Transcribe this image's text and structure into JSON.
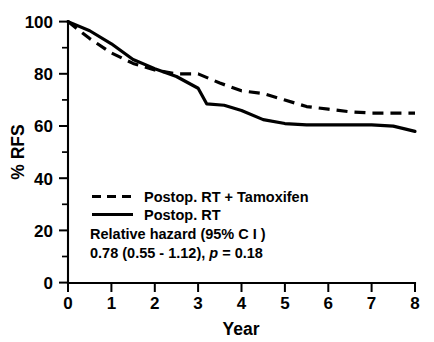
{
  "chart_data": {
    "type": "line",
    "title": "",
    "xlabel": "Year",
    "ylabel": "% RFS",
    "xlim": [
      0,
      8
    ],
    "ylim": [
      0,
      100
    ],
    "xticks": [
      "0",
      "1",
      "2",
      "3",
      "4",
      "5",
      "6",
      "7",
      "8"
    ],
    "yticks": [
      "0",
      "20",
      "40",
      "60",
      "80",
      "100"
    ],
    "y_minor_ticks": [
      10,
      30,
      50,
      70,
      90
    ],
    "grid": false,
    "legend_position": "inside-lower-left",
    "series": [
      {
        "name": "Postop. RT + Tamoxifen",
        "style": "dashed",
        "color": "#000000",
        "x": [
          0,
          0.5,
          1.0,
          1.5,
          2.0,
          2.5,
          3.0,
          3.5,
          4.0,
          4.5,
          5.0,
          5.5,
          6.0,
          6.5,
          7.0,
          7.5,
          8.0
        ],
        "y": [
          100,
          93.5,
          88.0,
          84.0,
          81.5,
          80.0,
          80.0,
          76.5,
          73.5,
          72.5,
          70.0,
          67.5,
          66.5,
          65.5,
          65.0,
          65.0,
          65.0
        ]
      },
      {
        "name": "Postop. RT",
        "style": "solid",
        "color": "#000000",
        "x": [
          0,
          0.5,
          1.0,
          1.5,
          2.0,
          2.5,
          3.0,
          3.2,
          3.6,
          4.0,
          4.5,
          5.0,
          5.5,
          6.0,
          6.5,
          7.0,
          7.5,
          8.0
        ],
        "y": [
          100,
          96.5,
          91.5,
          85.5,
          82.0,
          79.0,
          74.5,
          68.5,
          68.0,
          66.0,
          62.5,
          61.0,
          60.5,
          60.5,
          60.5,
          60.5,
          60.0,
          58.0
        ]
      }
    ],
    "annotations": [
      "Relative hazard (95% C I )",
      "0.78 (0.55 - 1.12), p = 0.18"
    ]
  },
  "legend": {
    "items": [
      {
        "label": "Postop. RT + Tamoxifen",
        "style": "dashed"
      },
      {
        "label": "Postop. RT",
        "style": "solid"
      }
    ]
  },
  "annotation": {
    "hazard_heading": "Relative hazard (95% C I )",
    "hazard_value_prefix": "0.78 (0.55 - 1.12), ",
    "hazard_p_symbol": "p",
    "hazard_p_value": " = 0.18"
  },
  "axes": {
    "y_title": "% RFS",
    "x_title": "Year",
    "y_tick_labels": [
      "100",
      "80",
      "60",
      "40",
      "20",
      "0"
    ],
    "x_tick_labels": [
      "0",
      "1",
      "2",
      "3",
      "4",
      "5",
      "6",
      "7",
      "8"
    ]
  }
}
